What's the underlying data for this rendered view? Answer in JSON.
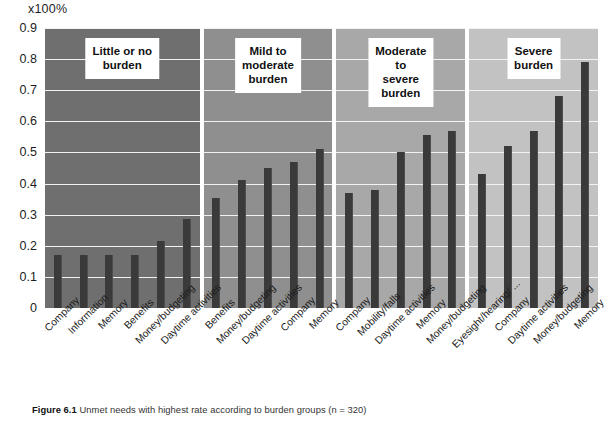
{
  "figure": {
    "unit_label": "x100%",
    "caption_label": "Figure 6.1",
    "caption_text": "Unmet needs with highest rate according to burden groups (n = 320)"
  },
  "axis": {
    "y_ticks": [
      "0.9",
      "0.8",
      "0.7",
      "0.6",
      "0.5",
      "0.4",
      "0.3",
      "0.2",
      "0.1",
      "0"
    ],
    "y_min": 0,
    "y_max": 0.9
  },
  "colors": {
    "bar": "#3a3a3a",
    "panel_1_bg": "#6f6f6f",
    "panel_2_bg": "#8f8f8f",
    "panel_3_bg": "#a8a8a8",
    "panel_4_bg": "#c2c2c2",
    "gridline": "#f2f2f2",
    "title_box_bg": "#ffffff"
  },
  "panels": [
    {
      "title": "Little or no\nburden",
      "bg": "#6f6f6f",
      "categories": [
        "Company",
        "Information",
        "Memory",
        "Benefits",
        "Money/budgeting",
        "Daytime activities"
      ],
      "values": [
        0.17,
        0.17,
        0.17,
        0.17,
        0.215,
        0.285
      ]
    },
    {
      "title": "Mild to moderate\nburden",
      "bg": "#8f8f8f",
      "categories": [
        "Benefits",
        "Money/budgeting",
        "Daytime activities",
        "Company",
        "Memory"
      ],
      "values": [
        0.355,
        0.41,
        0.45,
        0.47,
        0.51
      ]
    },
    {
      "title": "Moderate to\nsevere burden",
      "bg": "#a8a8a8",
      "categories": [
        "Company",
        "Mobility/falls",
        "Daytime activities",
        "Memory",
        "Money/budgeting"
      ],
      "values": [
        0.37,
        0.38,
        0.5,
        0.555,
        0.57
      ]
    },
    {
      "title": "Severe\nburden",
      "bg": "#c2c2c2",
      "categories": [
        "Eyesight/hearing/ ...",
        "Company",
        "Daytime activities",
        "Money/budgeting",
        "Memory"
      ],
      "values": [
        0.43,
        0.52,
        0.57,
        0.68,
        0.79
      ]
    }
  ],
  "chart_data": {
    "type": "bar",
    "title": "Unmet needs with highest rate according to burden groups (n = 320)",
    "xlabel": "",
    "ylabel": "x100%",
    "ylim": [
      0,
      0.9
    ],
    "grid": true,
    "legend": "none",
    "panel_layout": "4 side-by-side panels, shared y-axis",
    "panels": [
      {
        "name": "Little or no burden",
        "categories": [
          "Company",
          "Information",
          "Memory",
          "Benefits",
          "Money/budgeting",
          "Daytime activities"
        ],
        "values": [
          0.17,
          0.17,
          0.17,
          0.17,
          0.215,
          0.285
        ]
      },
      {
        "name": "Mild to moderate burden",
        "categories": [
          "Benefits",
          "Money/budgeting",
          "Daytime activities",
          "Company",
          "Memory"
        ],
        "values": [
          0.355,
          0.41,
          0.45,
          0.47,
          0.51
        ]
      },
      {
        "name": "Moderate to severe burden",
        "categories": [
          "Company",
          "Mobility/falls",
          "Daytime activities",
          "Memory",
          "Money/budgeting"
        ],
        "values": [
          0.37,
          0.38,
          0.5,
          0.555,
          0.57
        ]
      },
      {
        "name": "Severe burden",
        "categories": [
          "Eyesight/hearing/ ...",
          "Company",
          "Daytime activities",
          "Money/budgeting",
          "Memory"
        ],
        "values": [
          0.43,
          0.52,
          0.57,
          0.68,
          0.79
        ]
      }
    ],
    "yticks": [
      0,
      0.1,
      0.2,
      0.3,
      0.4,
      0.5,
      0.6,
      0.7,
      0.8,
      0.9
    ]
  }
}
